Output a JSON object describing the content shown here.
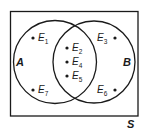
{
  "diagram": {
    "type": "venn",
    "universe": {
      "label": "S"
    },
    "sets": [
      {
        "id": "A",
        "label": "A"
      },
      {
        "id": "B",
        "label": "B"
      }
    ],
    "elements": [
      {
        "name": "E",
        "sub": "1",
        "region": "A only"
      },
      {
        "name": "E",
        "sub": "7",
        "region": "A only"
      },
      {
        "name": "E",
        "sub": "2",
        "region": "A and B"
      },
      {
        "name": "E",
        "sub": "4",
        "region": "A and B"
      },
      {
        "name": "E",
        "sub": "5",
        "region": "A and B"
      },
      {
        "name": "E",
        "sub": "3",
        "region": "B only"
      },
      {
        "name": "E",
        "sub": "6",
        "region": "B only"
      }
    ],
    "colors": {
      "stroke": "#1a1a1a",
      "background": "#ffffff"
    }
  }
}
